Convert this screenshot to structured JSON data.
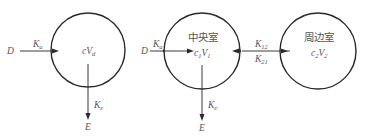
{
  "diagram": {
    "type": "pharmacokinetic compartment models",
    "one_compartment": {
      "input_label": "D",
      "absorption_rate": {
        "main": "K",
        "sub": "a"
      },
      "compartment_label": {
        "c": "c",
        "V": "V",
        "sub": "d"
      },
      "elimination_rate": {
        "main": "K",
        "sub": "e"
      },
      "output_label": "E"
    },
    "two_compartment": {
      "input_label": "D",
      "absorption_rate": {
        "main": "K",
        "sub": "a"
      },
      "central": {
        "title": "中央室",
        "c": "c",
        "c_sub": "1",
        "V": "V",
        "V_sub": "1"
      },
      "peripheral": {
        "title": "周边室",
        "c": "c",
        "c_sub": "2",
        "V": "V",
        "V_sub": "2"
      },
      "transfer_rate_12": {
        "main": "K",
        "sub": "12"
      },
      "transfer_rate_21": {
        "main": "K",
        "sub": "21"
      },
      "elimination_rate": {
        "main": "K",
        "sub": "e"
      },
      "output_label": "E"
    },
    "colors": {
      "stroke": "#2a2a2a",
      "text": "#555555",
      "background": "#ffffff"
    }
  }
}
